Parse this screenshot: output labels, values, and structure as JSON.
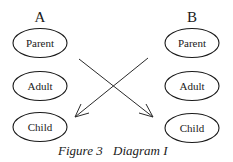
{
  "columns": [
    {
      "label": "A",
      "nodes": [
        "Parent",
        "Adult",
        "Child"
      ]
    },
    {
      "label": "B",
      "nodes": [
        "Parent",
        "Adult",
        "Child"
      ]
    }
  ],
  "arrows": [
    {
      "from": "A.Parent",
      "to": "B.Child"
    },
    {
      "from": "B.Parent",
      "to": "A.Child"
    }
  ],
  "caption": {
    "figure": "Figure 3",
    "title": "Diagram I"
  }
}
